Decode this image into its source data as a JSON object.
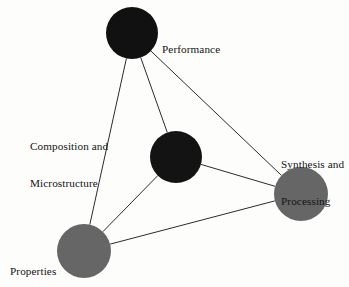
{
  "diagram": {
    "background_color": "#fdfdfc",
    "edge_color": "#2b2b2b",
    "nodes": [
      {
        "id": "performance",
        "label": "Performance",
        "label_lines": [
          "Performance"
        ],
        "color": "#111111",
        "cx": 132,
        "cy": 33,
        "r": 26
      },
      {
        "id": "composition",
        "label": "Composition and Microstructure",
        "label_lines": [
          "Composition and",
          "Microstructure"
        ],
        "color": "#131313",
        "cx": 176,
        "cy": 157,
        "r": 26
      },
      {
        "id": "synthesis",
        "label": "Synthesis and Processing",
        "label_lines": [
          "Synthesis and",
          "Processing"
        ],
        "color": "#666666",
        "cx": 301,
        "cy": 194,
        "r": 27
      },
      {
        "id": "properties",
        "label": "Properties",
        "label_lines": [
          "Properties"
        ],
        "color": "#666666",
        "cx": 84,
        "cy": 251,
        "r": 27
      }
    ],
    "edges": [
      {
        "from": "performance",
        "to": "properties"
      },
      {
        "from": "performance",
        "to": "composition"
      },
      {
        "from": "performance",
        "to": "synthesis"
      },
      {
        "from": "composition",
        "to": "properties"
      },
      {
        "from": "composition",
        "to": "synthesis"
      },
      {
        "from": "properties",
        "to": "synthesis"
      }
    ],
    "labels": {
      "performance": "Performance",
      "composition_line1": "Composition and",
      "composition_line2": "Microstructure",
      "synthesis_line1": "Synthesis and",
      "synthesis_line2": "Processing",
      "properties": "Properties"
    }
  }
}
